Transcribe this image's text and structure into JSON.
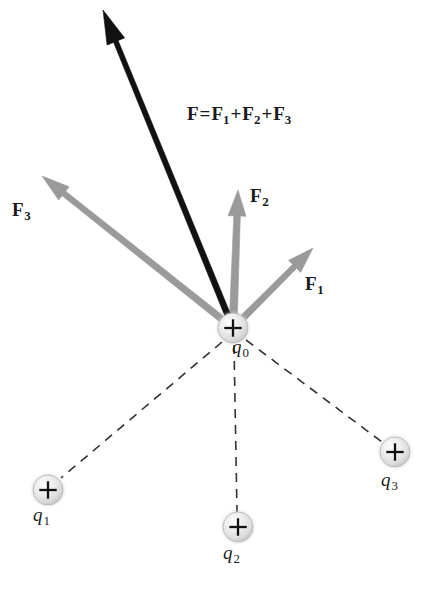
{
  "figure": {
    "background_color": "#ffffff",
    "width": 431,
    "height": 595
  },
  "colors": {
    "resultant_vector": "#111111",
    "component_vector": "#9a9a9a",
    "dashed_line": "#333333",
    "charge_sphere_light": "#f2f2f2",
    "charge_sphere_mid": "#d8d8d8",
    "charge_sphere_edge": "#b9b9b9",
    "text": "#1a1a1a"
  },
  "equation": {
    "lhs": "F",
    "equals": "=",
    "term1_symbol": "F",
    "term1_sub": "1",
    "plus1": "+",
    "term2_symbol": "F",
    "term2_sub": "2",
    "plus2": "+",
    "term3_symbol": "F",
    "term3_sub": "3",
    "plain_text": "F = F1 + F2 + F3"
  },
  "vectors": [
    {
      "id": "resultant",
      "symbol": "F",
      "subscript": "",
      "label": "F",
      "color": "#111111",
      "is_resultant": true,
      "origin": {
        "x": 233,
        "y": 328
      },
      "tip": {
        "x": 103,
        "y": 10
      },
      "shaft_width": 6,
      "head_length": 34,
      "head_width": 19,
      "label_pos": {
        "x": 0,
        "y": 0
      },
      "description": "resultant net force, black, up and to the left"
    },
    {
      "id": "f1",
      "symbol": "F",
      "subscript": "1",
      "label": "F1",
      "color": "#9a9a9a",
      "is_resultant": false,
      "origin": {
        "x": 233,
        "y": 328
      },
      "tip": {
        "x": 313,
        "y": 248
      },
      "shaft_width": 7,
      "head_length": 26,
      "head_width": 17,
      "label_pos": {
        "x": 305,
        "y": 274
      },
      "description": "force from q3, gray, up-right at about 45 degrees"
    },
    {
      "id": "f2",
      "symbol": "F",
      "subscript": "2",
      "label": "F2",
      "color": "#9a9a9a",
      "is_resultant": false,
      "origin": {
        "x": 233,
        "y": 328
      },
      "tip": {
        "x": 238,
        "y": 190
      },
      "shaft_width": 8,
      "head_length": 26,
      "head_width": 18,
      "label_pos": {
        "x": 250,
        "y": 186
      },
      "description": "force from q2, gray, pointing nearly straight up"
    },
    {
      "id": "f3",
      "symbol": "F",
      "subscript": "3",
      "label": "F3",
      "color": "#9a9a9a",
      "is_resultant": false,
      "origin": {
        "x": 233,
        "y": 328
      },
      "tip": {
        "x": 42,
        "y": 176
      },
      "shaft_width": 7,
      "head_length": 28,
      "head_width": 17,
      "label_pos": {
        "x": 12,
        "y": 200
      },
      "description": "force from q1, gray, up-left"
    }
  ],
  "charges": [
    {
      "id": "q0",
      "symbol": "q",
      "subscript": "0",
      "label": "q0",
      "sign": "+",
      "center": {
        "x": 233,
        "y": 328
      },
      "radius": 15,
      "label_pos": {
        "x": 232,
        "y": 337
      },
      "description": "central test charge where all forces act"
    },
    {
      "id": "q1",
      "symbol": "q",
      "subscript": "1",
      "label": "q1",
      "sign": "+",
      "center": {
        "x": 48,
        "y": 490
      },
      "radius": 15,
      "label_pos": {
        "x": 33,
        "y": 505
      },
      "description": "source charge lower-left"
    },
    {
      "id": "q2",
      "symbol": "q",
      "subscript": "2",
      "label": "q2",
      "sign": "+",
      "center": {
        "x": 238,
        "y": 527
      },
      "radius": 15,
      "label_pos": {
        "x": 223,
        "y": 543
      },
      "description": "source charge bottom-center"
    },
    {
      "id": "q3",
      "symbol": "q",
      "subscript": "3",
      "label": "q3",
      "sign": "+",
      "center": {
        "x": 395,
        "y": 452
      },
      "radius": 15,
      "label_pos": {
        "x": 381,
        "y": 470
      },
      "description": "source charge lower-right"
    }
  ],
  "dashed_connectors": [
    {
      "id": "q0-q1",
      "from": "q0",
      "to": "q1",
      "x1": 222,
      "y1": 342,
      "x2": 61,
      "y2": 478
    },
    {
      "id": "q0-q2",
      "from": "q0",
      "to": "q2",
      "x1": 234,
      "y1": 345,
      "x2": 237,
      "y2": 512
    },
    {
      "id": "q0-q3",
      "from": "q0",
      "to": "q3",
      "x1": 246,
      "y1": 340,
      "x2": 382,
      "y2": 442
    }
  ],
  "style": {
    "dash_pattern": "9 7",
    "dash_width": 1.6
  }
}
